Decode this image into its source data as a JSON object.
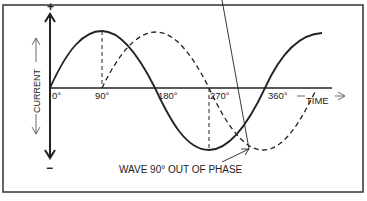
{
  "diagram": {
    "title": "",
    "axis": {
      "positive_label": "+",
      "negative_label": "−",
      "vertical_label": "CURRENT",
      "horizontal_label": "TIME"
    },
    "ticks": [
      "0°",
      "90°",
      "180°",
      "270°",
      "360°"
    ],
    "annotation": "WAVE 90° OUT OF PHASE",
    "series": [
      {
        "name": "reference-wave",
        "style": "solid"
      },
      {
        "name": "wave-90-out-of-phase",
        "style": "dashed"
      }
    ],
    "colors": {
      "ink": "#222222",
      "background": "#ffffff"
    }
  }
}
